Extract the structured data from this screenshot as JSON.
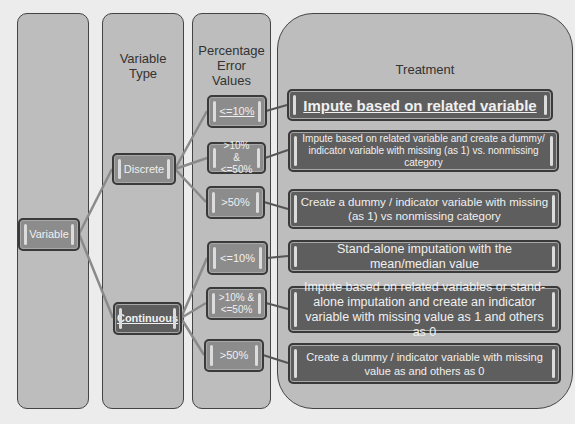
{
  "columns": {
    "variable": {
      "title": ""
    },
    "variable_type": {
      "title_line1": "Variable",
      "title_line2": "Type"
    },
    "percentage_error": {
      "title_line1": "Percentage",
      "title_line2": "Error",
      "title_line3": "Values"
    },
    "treatment": {
      "title": "Treatment"
    }
  },
  "root": {
    "label": "Variable"
  },
  "types": [
    {
      "label": "Discrete"
    },
    {
      "label": "Continuous"
    }
  ],
  "discrete": {
    "ranges": [
      {
        "label": "<=10%"
      },
      {
        "label_line1": ">10% &",
        "label_line2": "<=50%"
      },
      {
        "label": ">50%"
      }
    ],
    "treatments": [
      {
        "label": "Impute based on related variable"
      },
      {
        "label": "Impute based on related variable and create a dummy/ indicator variable with missing (as 1) vs. nonmissing category"
      },
      {
        "label": "Create a dummy / indicator variable with missing (as 1) vs nonmissing category"
      }
    ]
  },
  "continuous": {
    "ranges": [
      {
        "label": "<=10%"
      },
      {
        "label_line1": ">10% &",
        "label_line2": "<=50%"
      },
      {
        "label": ">50%"
      }
    ],
    "treatments": [
      {
        "label": "Stand-alone imputation with the mean/median value"
      },
      {
        "label": "Impute based on related variables or stand-alone imputation and create an indicator variable with missing value as 1 and others as 0"
      },
      {
        "label": "Create a dummy / indicator variable with missing value as and others as 0"
      }
    ]
  },
  "colors": {
    "background": "#ececec",
    "column_fill": "#bdbdbd",
    "node_fill": "#8c8c8c",
    "treatment_fill": "#5e5e5e",
    "connector": "#8a8a8a"
  }
}
